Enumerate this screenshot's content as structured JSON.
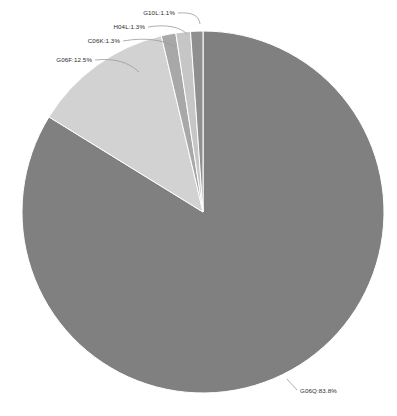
{
  "chart_data": {
    "type": "pie",
    "title": "",
    "subtitle": "",
    "xlabel": "",
    "ylabel": "",
    "legend_position": "none",
    "grid": false,
    "unit": "%",
    "label_format": "{name}:{value}%",
    "categories": [
      "G06Q",
      "G06F",
      "C06K",
      "H04L",
      "G10L"
    ],
    "values": [
      83.8,
      12.5,
      1.3,
      1.3,
      1.1
    ],
    "colors": [
      "#808080",
      "#d2d2d2",
      "#a8a8a8",
      "#c6c6c6",
      "#8f8f8f"
    ],
    "start_angle_deg": 0,
    "direction": "clockwise",
    "center": {
      "x": 203,
      "y": 212
    },
    "radius": 181,
    "slices": [
      {
        "name": "G06Q",
        "value": 83.8,
        "label": "G06Q:83.8%",
        "color": "#808080",
        "label_x": 300,
        "label_y": 393,
        "anchor": "start",
        "leader": "M 287 379 L 297 390"
      },
      {
        "name": "G06F",
        "value": 12.5,
        "label": "G06F:12.5%",
        "color": "#d2d2d2",
        "label_x": 92,
        "label_y": 62,
        "anchor": "end",
        "leader": "M 95 60 C 115 58 128 62 139 72"
      },
      {
        "name": "C06K",
        "value": 1.3,
        "label": "C06K:1.3%",
        "color": "#a8a8a8",
        "label_x": 120,
        "label_y": 43,
        "anchor": "end",
        "leader": "M 123 41 C 146 37 163 40 175 47"
      },
      {
        "name": "H04L",
        "value": 1.3,
        "label": "H04L:1.3%",
        "color": "#c6c6c6",
        "label_x": 145,
        "label_y": 29,
        "anchor": "end",
        "leader": "M 148 27 C 167 24 180 27 187 34"
      },
      {
        "name": "G10L",
        "value": 1.1,
        "label": "G10L:1.1%",
        "color": "#8f8f8f",
        "label_x": 175,
        "label_y": 15,
        "anchor": "end",
        "leader": "M 178 13 C 193 12 199 16 200 24"
      }
    ]
  },
  "figure": {
    "background": "#ffffff",
    "label_color": "#2b2b2b",
    "leader_color": "#9a9a9a",
    "separator_color": "#ffffff"
  }
}
